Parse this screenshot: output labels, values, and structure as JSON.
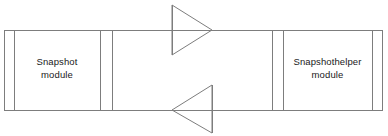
{
  "diagram": {
    "type": "block-diagram",
    "width": 388,
    "height": 136,
    "background_color": "#ffffff",
    "line_color": "#7d7d7d",
    "text_color": "#1a1a1a",
    "modules": [
      {
        "id": "snapshot",
        "name_line1": "Snapshot",
        "name_line2": "module",
        "side": "left",
        "bounds": {
          "x": 4,
          "y": 30,
          "width": 108,
          "height": 80
        }
      },
      {
        "id": "snapshothelper",
        "name_line1": "Snapshothelper",
        "name_line2": "module",
        "side": "right",
        "bounds": {
          "x": 272,
          "y": 30,
          "width": 111,
          "height": 80
        }
      }
    ],
    "connectors": [
      {
        "id": "top-connector",
        "direction": "left-to-right",
        "from": "snapshot",
        "to": "snapshothelper",
        "line_y": 30,
        "arrow_shape": "triangle",
        "arrow_points": "172,5 212,30 172,55"
      },
      {
        "id": "bottom-connector",
        "direction": "right-to-left",
        "from": "snapshothelper",
        "to": "snapshot",
        "line_y": 110,
        "arrow_shape": "triangle",
        "arrow_points": "212,85 172,110 212,133"
      }
    ]
  }
}
